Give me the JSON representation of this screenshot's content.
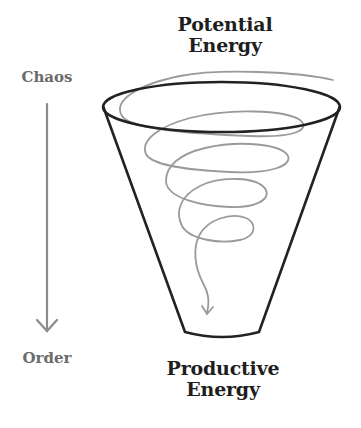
{
  "diagram": {
    "top_label_line1": "Potential",
    "top_label_line2": "Energy",
    "bottom_label_line1": "Productive",
    "bottom_label_line2": "Energy",
    "axis_start_label": "Chaos",
    "axis_end_label": "Order"
  },
  "colors": {
    "funnel_stroke": "#222222",
    "spiral_stroke": "#9a9a9a",
    "axis_arrow": "#8c8c8c",
    "title_text": "#1e1e1e",
    "axis_text": "#6b6b6b"
  }
}
